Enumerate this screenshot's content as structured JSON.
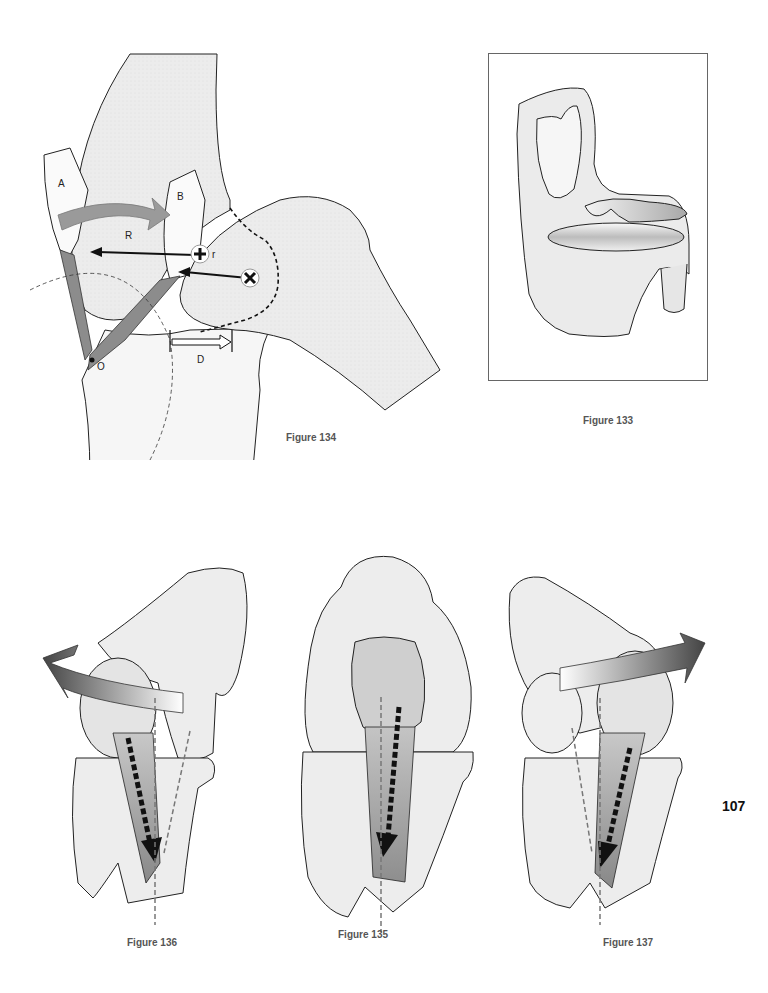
{
  "page": {
    "page_number": "107",
    "colors": {
      "bone_fill": "#ededed",
      "bone_fill_light": "#f4f4f4",
      "outline": "#222222",
      "ligament": "#8c8c8c",
      "arrow_dark": "#555555",
      "dashed_axis": "#777777",
      "caption": "#555555"
    }
  },
  "figures": {
    "fig134": {
      "caption": "Figure 134",
      "labels": {
        "a": "A",
        "b": "B",
        "r_upper": "R",
        "r_lower": "r",
        "d": "D",
        "o": "O"
      },
      "symbols": [
        "plus-center-icon",
        "cross-center-icon"
      ]
    },
    "fig133": {
      "caption": "Figure 133"
    },
    "fig136": {
      "caption": "Figure 136"
    },
    "fig135": {
      "caption": "Figure 135"
    },
    "fig137": {
      "caption": "Figure 137"
    }
  }
}
